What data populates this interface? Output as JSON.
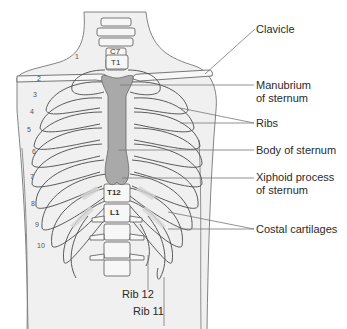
{
  "labels": {
    "clavicle": "Clavicle",
    "manubrium_1": "Manubrium",
    "manubrium_2": "of sternum",
    "ribs": "Ribs",
    "body_of_sternum": "Body of sternum",
    "xiphoid_1": "Xiphoid process",
    "xiphoid_2": "of sternum",
    "costal_cartilages": "Costal cartilages",
    "rib12": "Rib 12",
    "rib11": "Rib 11"
  },
  "vertebrae": {
    "c7": "C7",
    "t1": "T1",
    "t12": "T12",
    "l1": "L1"
  },
  "rib_numbers": [
    "1",
    "2",
    "3",
    "4",
    "5",
    "6",
    "7",
    "8",
    "9",
    "10"
  ],
  "colors": {
    "skin": "#f0f0f0",
    "bone": "#f7f7f7",
    "cartilage": "#d6d6d6",
    "sternum": "#a9a9a9",
    "outline": "#4a4a4a",
    "leader": "#777777"
  }
}
